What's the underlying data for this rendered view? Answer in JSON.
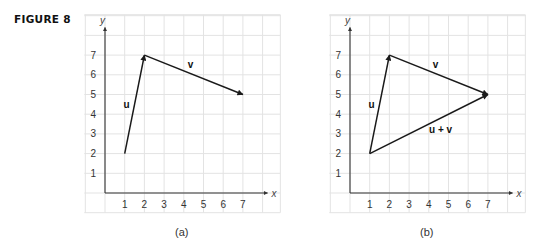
{
  "figure_label": "FIGURE 8",
  "panels": [
    {
      "id": "a",
      "caption": "(a)",
      "x_axis_label": "x",
      "y_axis_label": "y",
      "x_ticks": [
        "1",
        "2",
        "3",
        "4",
        "5",
        "6",
        "7"
      ],
      "y_ticks": [
        "1",
        "2",
        "3",
        "4",
        "5",
        "6",
        "7"
      ],
      "vectors": [
        {
          "name": "u",
          "label": "u",
          "from": [
            1,
            2
          ],
          "to": [
            2,
            7
          ]
        },
        {
          "name": "v",
          "label": "v",
          "from": [
            2,
            7
          ],
          "to": [
            7,
            5
          ]
        }
      ]
    },
    {
      "id": "b",
      "caption": "(b)",
      "x_axis_label": "x",
      "y_axis_label": "y",
      "x_ticks": [
        "1",
        "2",
        "3",
        "4",
        "5",
        "6",
        "7"
      ],
      "y_ticks": [
        "1",
        "2",
        "3",
        "4",
        "5",
        "6",
        "7"
      ],
      "vectors": [
        {
          "name": "u",
          "label": "u",
          "from": [
            1,
            2
          ],
          "to": [
            2,
            7
          ]
        },
        {
          "name": "v",
          "label": "v",
          "from": [
            2,
            7
          ],
          "to": [
            7,
            5
          ]
        },
        {
          "name": "u-plus-v",
          "label": "u + v",
          "from": [
            1,
            2
          ],
          "to": [
            7,
            5
          ]
        }
      ]
    }
  ],
  "colors": {
    "grid": "#e3e3e3",
    "axis": "#333333",
    "vector": "#1a1a1a",
    "text": "#333333"
  }
}
